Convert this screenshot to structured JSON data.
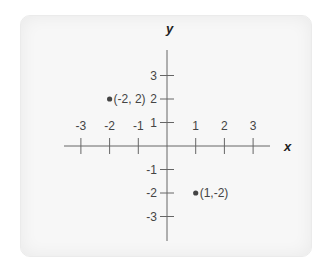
{
  "chart_data": {
    "type": "scatter",
    "title": "",
    "xlabel": "x",
    "ylabel": "y",
    "xlim": [
      -3.5,
      3.5
    ],
    "ylim": [
      -3.5,
      3.5
    ],
    "grid": false,
    "x_ticks": [
      -3,
      -2,
      -1,
      1,
      2,
      3
    ],
    "y_ticks": [
      3,
      2,
      1,
      -1,
      -2,
      -3
    ],
    "x_tick_labels": [
      "-3",
      "-2",
      "-1",
      "1",
      "2",
      "3"
    ],
    "y_tick_labels": [
      "3",
      "2",
      "1",
      "-1",
      "-2",
      "-3"
    ],
    "points": [
      {
        "x": -2,
        "y": 2,
        "label": "(-2, 2)"
      },
      {
        "x": 1,
        "y": -2,
        "label": "(1,-2)"
      }
    ],
    "colors": {
      "axis": "#555555",
      "point": "#444444",
      "background": "#f7f7f7"
    }
  }
}
